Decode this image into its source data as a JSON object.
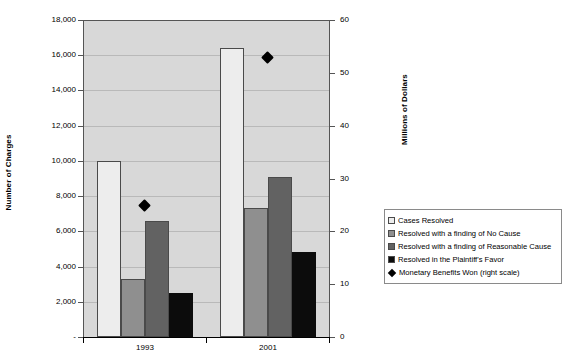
{
  "chart_data": {
    "type": "bar",
    "title": "",
    "subtitle": "",
    "categories": [
      "1993",
      "2001"
    ],
    "xlabel": "",
    "ylabel": "Number of Charges",
    "ylabel_right": "Millions of Dollars",
    "ylim": [
      0,
      18000
    ],
    "ylim_right": [
      0,
      60
    ],
    "grid": true,
    "legend_position": "right",
    "y_ticks": [
      "-",
      "2,000",
      "4,000",
      "6,000",
      "8,000",
      "10,000",
      "12,000",
      "14,000",
      "16,000",
      "18,000"
    ],
    "y_tick_values": [
      0,
      2000,
      4000,
      6000,
      8000,
      10000,
      12000,
      14000,
      16000,
      18000
    ],
    "y_ticks_right": [
      "0",
      "10",
      "20",
      "30",
      "40",
      "50",
      "60"
    ],
    "y_tick_values_right": [
      0,
      10,
      20,
      30,
      40,
      50,
      60
    ],
    "series": [
      {
        "name": "Cases Resolved",
        "kind": "bar",
        "axis": "left",
        "color": "#ededed",
        "values": [
          10000,
          16400
        ]
      },
      {
        "name": "Resolved with a finding of No Cause",
        "kind": "bar",
        "axis": "left",
        "color": "#8f8f8f",
        "values": [
          3300,
          7300
        ]
      },
      {
        "name": "Resolved with a finding of Reasonable Cause",
        "kind": "bar",
        "axis": "left",
        "color": "#626262",
        "values": [
          6600,
          9100
        ]
      },
      {
        "name": "Resolved in the Plaintiff's Favor",
        "kind": "bar",
        "axis": "left",
        "color": "#0c0c0c",
        "values": [
          2500,
          4800
        ]
      },
      {
        "name": "Monetary Benefits Won (right scale)",
        "kind": "marker",
        "axis": "right",
        "color": "#000000",
        "values": [
          25,
          53
        ]
      }
    ]
  },
  "legend": {
    "items": [
      {
        "label": "Cases Resolved",
        "swatch": "#ededed",
        "marker": "square"
      },
      {
        "label": "Resolved with a finding of No Cause",
        "swatch": "#8f8f8f",
        "marker": "square"
      },
      {
        "label": "Resolved with a finding of Reasonable Cause",
        "swatch": "#626262",
        "marker": "square"
      },
      {
        "label": "Resolved in the Plaintiff's Favor",
        "swatch": "#0c0c0c",
        "marker": "square"
      },
      {
        "label": "Monetary Benefits Won (right scale)",
        "swatch": "#000000",
        "marker": "diamond"
      }
    ]
  },
  "axes": {
    "left_title": "Number of Charges",
    "right_title": "Millions of Dollars"
  },
  "colors": {
    "plot_background": "#d8d8d8",
    "gridline": "#b9b9b9",
    "axis_line": "#555555",
    "text": "#000000"
  }
}
